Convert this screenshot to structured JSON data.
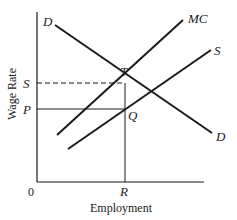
{
  "diagram": {
    "title": "",
    "axes": {
      "x_label": "Employment",
      "y_label": "Wage Rate",
      "origin_label": "0"
    },
    "curves": [
      {
        "id": "demand",
        "label_start": "D",
        "label_end": "D"
      },
      {
        "id": "marginal-cost",
        "label": "MC"
      },
      {
        "id": "supply",
        "label": "S"
      }
    ],
    "points": {
      "T": "T",
      "Q": "Q"
    },
    "axis_marks": {
      "y_upper": "S",
      "y_lower": "P",
      "x_mark": "R"
    },
    "colors": {
      "line": "#1a1a1a",
      "background": "#ffffff"
    }
  }
}
